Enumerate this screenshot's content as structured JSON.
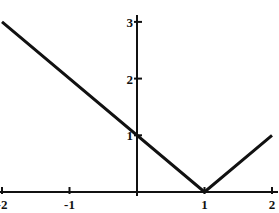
{
  "chart_data": {
    "type": "line",
    "title": "",
    "subtitle": "",
    "xlabel": "",
    "ylabel": "",
    "xlim": [
      -2,
      2
    ],
    "ylim": [
      0,
      3
    ],
    "grid": false,
    "legend": null,
    "annotations": [],
    "axis_style": {
      "x_axis_at_y": 0,
      "y_axis_at_x": 0,
      "zero_label_hidden": true,
      "tick_direction": "inward",
      "line_color": "#111111",
      "line_width_px": 3,
      "axis_width_px": 2
    },
    "xticks": [
      -2,
      -1,
      1,
      2
    ],
    "xtick_labels": [
      "-2",
      "-1",
      "1",
      "2"
    ],
    "yticks": [
      1,
      2,
      3
    ],
    "ytick_labels": [
      "1",
      "2",
      "3"
    ],
    "series": [
      {
        "name": "y = |x - 1|",
        "color": "#111111",
        "x": [
          -2,
          1,
          2
        ],
        "y": [
          3,
          0,
          1
        ],
        "points": [
          {
            "x": -2,
            "y": 3
          },
          {
            "x": 1,
            "y": 0
          },
          {
            "x": 2,
            "y": 1
          }
        ],
        "vertex": {
          "x": 1,
          "y": 0
        },
        "y_intercept": {
          "x": 0,
          "y": 1
        }
      }
    ]
  },
  "geometry": {
    "width": 279,
    "height": 213,
    "origin_px": {
      "x": 137,
      "y": 192
    },
    "unit_px": {
      "x": 67.5,
      "y": 56.7
    }
  }
}
